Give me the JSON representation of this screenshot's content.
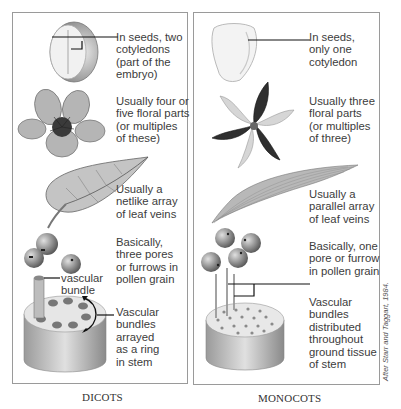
{
  "figure": {
    "credit": "After Starr and Taggart, 1984.",
    "panels": [
      {
        "id": "dicots",
        "caption": "DICOTS",
        "features": [
          {
            "name": "seed",
            "label": "In seeds, two\ncotyledons\n(part of the\nembryo)"
          },
          {
            "name": "flower",
            "label": "Usually four or\nfive floral parts\n(or multiples\nof these)"
          },
          {
            "name": "leaf",
            "label": "Usually a\nnetlike array\nof leaf veins"
          },
          {
            "name": "pollen",
            "label": "Basically,\nthree pores\nor furrows in\npollen grain"
          },
          {
            "name": "stem-callout",
            "label": "vascular\nbundle"
          },
          {
            "name": "stem",
            "label": "Vascular\nbundles\narrayed\nas a ring\nin stem"
          }
        ]
      },
      {
        "id": "monocots",
        "caption": "MONOCOTS",
        "features": [
          {
            "name": "seed",
            "label": "In seeds,\nonly one\ncotyledon"
          },
          {
            "name": "flower",
            "label": "Usually three\nfloral parts\n(or multiples\nof three)"
          },
          {
            "name": "leaf",
            "label": "Usually a\nparallel array\nof leaf veins"
          },
          {
            "name": "pollen",
            "label": "Basically, one\npore or furrow\nin pollen grain"
          },
          {
            "name": "stem",
            "label": "Vascular\nbundles\ndistributed\nthroughout\nground tissue\nof stem"
          }
        ]
      }
    ]
  },
  "colors": {
    "border": "#9a9a9a",
    "text": "#3c3c3c",
    "ink": "#111111"
  }
}
